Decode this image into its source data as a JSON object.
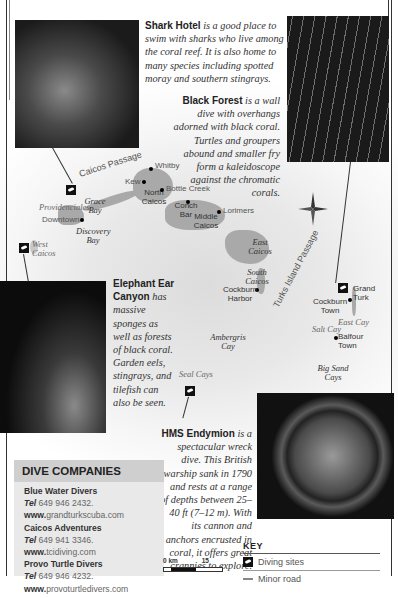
{
  "descriptions": {
    "shark_hotel": {
      "title": "Shark Hotel",
      "text": "is a good place to swim with sharks who live among the coral reef. It is also home to many species including spotted moray and southern stingrays."
    },
    "black_forest": {
      "title": "Black Forest",
      "text": "is a wall dive with overhangs adorned with black coral. Turtles and groupers abound and smaller fry form a kaleidoscope against the chromatic corals."
    },
    "elephant_ear": {
      "title": "Elephant Ear Canyon",
      "text": "has massive sponges as well as forests of black coral. Garden eels, stingrays, and tilefish can also be seen."
    },
    "hms_endymion": {
      "title": "HMS Endymion",
      "text": "is a spectacular wreck dive. This British warship sank in 1790 and rests at a range of depths between 25–40 ft (7–12 m). With its cannon and anchors encrusted in coral, it offers great crannies to explore."
    }
  },
  "map": {
    "water_labels": {
      "caicos_passage": "Caicos Passage",
      "turks_island_passage": "Turks Island Passage"
    },
    "islands": {
      "north_caicos": "North Caicos",
      "middle_caicos": "Middle Caicos",
      "east_caicos": "East Caicos",
      "south_caicos": "South Caicos",
      "west_caicos": "West Caicos",
      "grand_turk": "Grand Turk",
      "providenciales": "Providenciales",
      "ambergris_cay": "Ambergris Cay",
      "seal_cays": "Seal Cays",
      "salt_cay": "Salt Cay",
      "east_cay": "East Cay",
      "big_sand_cays": "Big Sand Cays"
    },
    "bays": {
      "grace_bay": "Grace Bay",
      "discovery_bay": "Discovery Bay"
    },
    "towns": {
      "whitby": "Whitby",
      "kew": "Kew",
      "bottle_creek": "Bottle Creek",
      "conch_bar": "Conch Bar",
      "lorimers": "Lorimers",
      "downtown": "Downtown",
      "cockburn_harbor": "Cockburn Harbor",
      "cockburn_town": "Cockburn Town",
      "balfour_town": "Balfour Town"
    }
  },
  "dive_companies": {
    "title": "DIVE COMPANIES",
    "tel_label": "Tel",
    "www_label": "www.",
    "items": [
      {
        "name": "Blue Water Divers",
        "tel": "649 946 2432.",
        "web": "grandturkscuba.com"
      },
      {
        "name": "Caicos Adventures",
        "tel": "649 941 3346.",
        "web": "tcidiving.com"
      },
      {
        "name": "Provo Turtle Divers",
        "tel": "649 946 4232.",
        "web": "provoturtledivers.com"
      }
    ]
  },
  "scale": {
    "start": "0 km",
    "end": "15"
  },
  "key": {
    "title": "KEY",
    "items": [
      {
        "label": "Diving sites"
      },
      {
        "label": "Minor road"
      }
    ]
  }
}
